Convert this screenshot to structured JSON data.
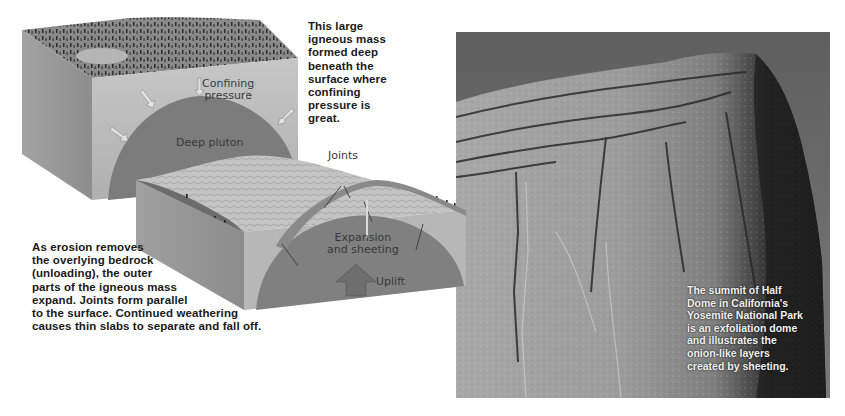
{
  "figure": {
    "top_block": {
      "labels": {
        "confining_pressure": "Confining\npressure",
        "deep_pluton": "Deep pluton"
      },
      "caption": "This large\nigneous mass\nformed deep\nbeneath the\nsurface where\nconfining\npressure is\ngreat."
    },
    "bottom_block": {
      "labels": {
        "joints": "Joints",
        "expansion": "Expansion\nand sheeting",
        "uplift": "Uplift"
      },
      "caption": "As erosion removes\nthe overlying bedrock\n(unloading), the outer\nparts of the igneous mass\nexpand. Joints form parallel\nto the surface. Continued weathering\ncauses thin slabs to separate and fall off."
    },
    "photo": {
      "subject": "Half Dome, Yosemite National Park",
      "caption": "The summit of Half\nDome in California's\nYosemite National Park\nis an exfoliation dome\nand illustrates the\nonion-like layers\ncreated by sheeting."
    },
    "colors": {
      "block_side_light": "#b9b9b9",
      "block_side_dark": "#8e8e8e",
      "pluton": "#7c7c7c",
      "sky": "#6e6e6e",
      "rock": "#9a9a9a",
      "text": "#1a1a1a"
    }
  }
}
